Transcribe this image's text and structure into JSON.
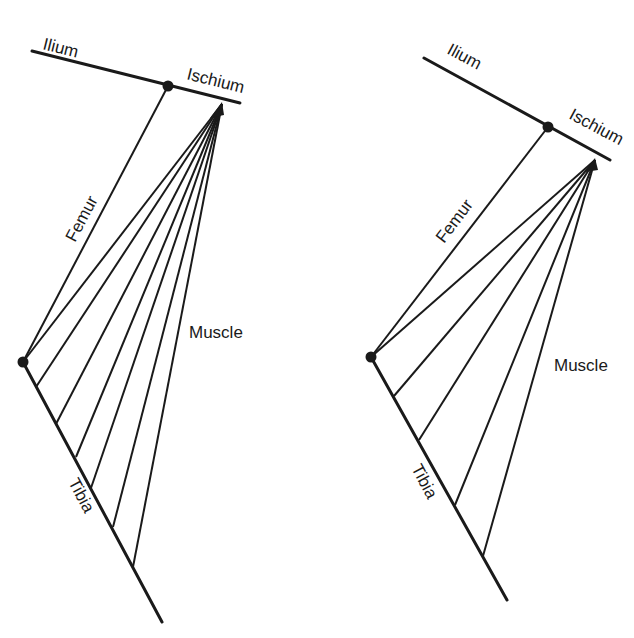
{
  "diagrams": [
    {
      "id": "left",
      "labels": {
        "ilium": "Ilium",
        "ischium": "Ischium",
        "femur": "Femur",
        "muscle": "Muscle",
        "tibia": "Tibia"
      },
      "muscle_fiber_count": 7
    },
    {
      "id": "right",
      "labels": {
        "ilium": "Ilium",
        "ischium": "Ischium",
        "femur": "Femur",
        "muscle": "Muscle",
        "tibia": "Tibia"
      },
      "muscle_fiber_count": 5
    }
  ],
  "colors": {
    "line": "#1a1a1a",
    "background": "#ffffff"
  }
}
